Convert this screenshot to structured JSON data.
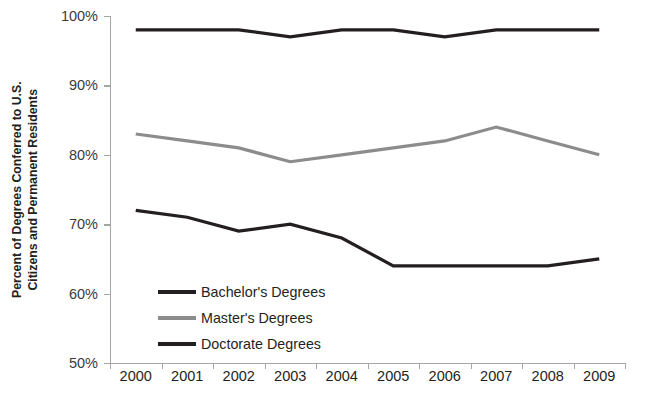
{
  "chart_data": {
    "type": "line",
    "title": "",
    "xlabel": "",
    "ylabel": "Percent of Degrees Conferred to U.S. Citizens and Permanent Residents",
    "ylabel_lines": [
      "Percent of Degrees Conferred to U.S.",
      "Citizens and Permanent Residents"
    ],
    "categories": [
      "2000",
      "2001",
      "2002",
      "2003",
      "2004",
      "2005",
      "2006",
      "2007",
      "2008",
      "2009"
    ],
    "x": [
      2000,
      2001,
      2002,
      2003,
      2004,
      2005,
      2006,
      2007,
      2008,
      2009
    ],
    "ylim": [
      50,
      100
    ],
    "ytick_values": [
      50,
      60,
      70,
      80,
      90,
      100
    ],
    "ytick_labels": [
      "50%",
      "60%",
      "70%",
      "80%",
      "90%",
      "100%"
    ],
    "grid": false,
    "legend_position": "inside-lower-left",
    "units": "percent",
    "series": [
      {
        "name": "Bachelor's Degrees",
        "color": "#231f20",
        "width": 3.2,
        "values": [
          98,
          98,
          98,
          97,
          98,
          98,
          97,
          98,
          98,
          98
        ]
      },
      {
        "name": "Master's Degrees",
        "color": "#8c8c8c",
        "width": 3.2,
        "values": [
          83,
          82,
          81,
          79,
          80,
          81,
          82,
          84,
          82,
          80
        ]
      },
      {
        "name": "Doctorate Degrees",
        "color": "#231f20",
        "width": 3.2,
        "values": [
          72,
          71,
          69,
          70,
          68,
          64,
          64,
          64,
          64,
          65
        ]
      }
    ]
  },
  "legend": {
    "items": [
      {
        "label": "Bachelor's Degrees",
        "color": "#231f20"
      },
      {
        "label": "Master's Degrees",
        "color": "#8c8c8c"
      },
      {
        "label": "Doctorate Degrees",
        "color": "#231f20"
      }
    ]
  },
  "axes": {
    "y_title_line1": "Percent of Degrees Conferred to U.S.",
    "y_title_line2": "Citizens and Permanent Residents",
    "axis_color": "#a6a6a6"
  }
}
